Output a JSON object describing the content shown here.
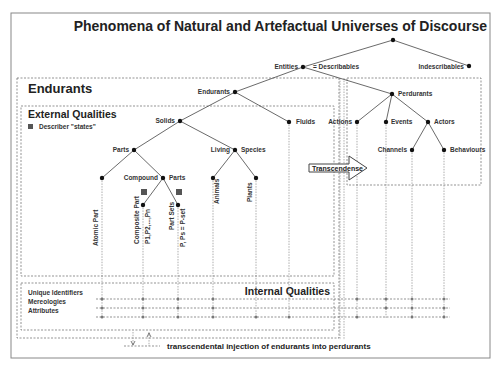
{
  "title": "Phenomena of Natural and Artefactual Universes of Discourse",
  "sections": {
    "endurants": "Endurants",
    "external_qualities": "External Qualities",
    "describer_legend": "Describer \"states\"",
    "internal_qualities": "Internal Qualities"
  },
  "nodes": {
    "entities": "Entities",
    "describables": "= Describables",
    "indescribables": "Indescribables",
    "endurants": "Endurants",
    "perdurants": "Perdurants",
    "solids": "Solids",
    "fluids": "Fluids",
    "parts": "Parts",
    "living": "Living",
    "species": "Species",
    "atomic_part": "Atomic Part",
    "compound": "Compound",
    "compound_parts": "Parts",
    "composite_part": "Composite Part",
    "composite_states": "P1,P2,...,Pn",
    "part_sets": "Part Sets",
    "part_sets_states": "P, Ps = P-set",
    "animals": "Animals",
    "plants": "Plants",
    "actions": "Actions",
    "events": "Events",
    "actors": "Actors",
    "channels": "Channels",
    "behaviours": "Behaviours"
  },
  "internal_rows": [
    "Unique Identifiers",
    "Mereologies",
    "Attributes"
  ],
  "transcendense_label": "Transcendense",
  "footer_label": "transcendental injection of endurants into perdurants"
}
